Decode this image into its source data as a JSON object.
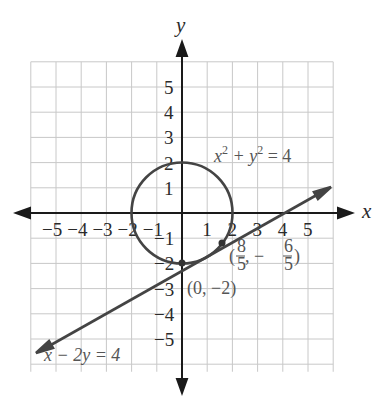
{
  "chart_data": {
    "type": "line",
    "title": "",
    "xlabel": "x",
    "ylabel": "y",
    "xlim": [
      -6,
      6
    ],
    "ylim": [
      -6,
      6
    ],
    "grid": true,
    "x_ticks": [
      "-5",
      "-4",
      "-3",
      "-2",
      "-1",
      "1",
      "2",
      "3",
      "4",
      "5"
    ],
    "y_ticks": [
      "5",
      "4",
      "3",
      "2",
      "1",
      "-1",
      "-2",
      "-3",
      "-4",
      "-5"
    ],
    "series": [
      {
        "name": "x^2 + y^2 = 4",
        "kind": "circle",
        "center": [
          0,
          0
        ],
        "radius": 2
      },
      {
        "name": "x - 2y = 4",
        "kind": "line",
        "slope": 0.5,
        "intercept": -2,
        "x_range": [
          -5.9,
          5.9
        ]
      }
    ],
    "annotations": [
      {
        "label": "(8/5, -6/5)",
        "x": 1.6,
        "y": -1.2
      },
      {
        "label": "(0, -2)",
        "x": 0,
        "y": -2
      }
    ]
  },
  "labels": {
    "x_axis": "x",
    "y_axis": "y",
    "circle_eq": {
      "base1": "x",
      "sup1": "2",
      "mid": " + y",
      "sup2": "2",
      "tail": " = 4"
    },
    "line_eq": "x − 2y = 4",
    "point1": {
      "open": "(",
      "num1": "8",
      "den1": "5",
      "comma": ", −",
      "num2": "6",
      "den2": "5",
      "close": ")"
    },
    "point2": "(0, −2)"
  },
  "colors": {
    "axis": "#1a1a1a",
    "curve": "#444444",
    "grid": "#c8c8c8",
    "text": "#555555"
  }
}
